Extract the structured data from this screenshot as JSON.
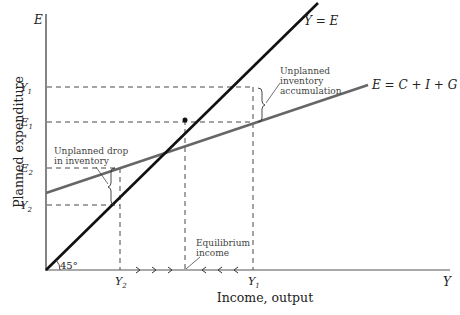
{
  "diagram": {
    "type": "keynesian-cross",
    "axes": {
      "y_axis_label": "Planned expenditure",
      "y_axis_symbol": "E",
      "x_axis_label": "Income, output",
      "x_axis_symbol": "Y",
      "angle_label": "45°"
    },
    "lines": {
      "forty_five": {
        "label": "Y = E",
        "color": "#1a1a1a"
      },
      "planned_expenditure": {
        "label": "E = C + I + G",
        "color": "#666666"
      }
    },
    "y_ticks": {
      "y1": "Y",
      "y1_sub": "1",
      "e1": "E",
      "e1_sub": "1",
      "e2": "E",
      "e2_sub": "2",
      "y2": "Y",
      "y2_sub": "2"
    },
    "x_ticks": {
      "y2": "Y",
      "y2_sub": "2",
      "y1": "Y",
      "y1_sub": "1"
    },
    "annotations": {
      "accumulation_line1": "Unplanned",
      "accumulation_line2": "inventory",
      "accumulation_line3": "accumulation",
      "drop_line1": "Unplanned drop",
      "drop_line2": "in inventory",
      "equilibrium_line1": "Equilibrium",
      "equilibrium_line2": "income"
    }
  }
}
